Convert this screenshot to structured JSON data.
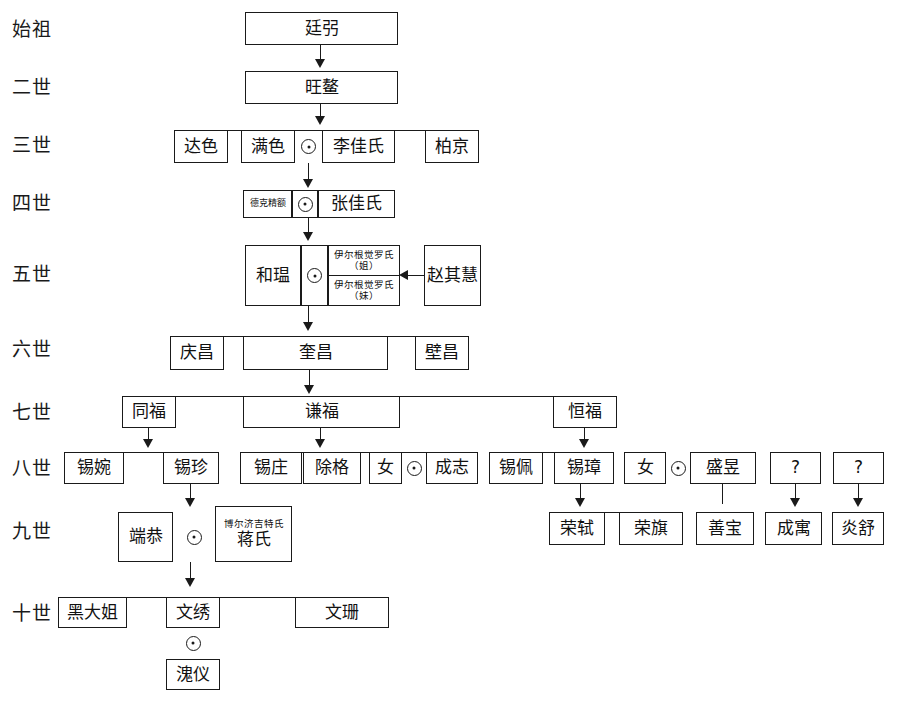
{
  "diagram": {
    "type": "genealogy-tree",
    "ink_color": "#1a1a1a",
    "background": "#ffffff",
    "marriage_symbol": "⊙",
    "unknown_label": "?"
  },
  "generations": [
    {
      "key": "g1",
      "label": "始祖"
    },
    {
      "key": "g2",
      "label": "二世"
    },
    {
      "key": "g3",
      "label": "三世"
    },
    {
      "key": "g4",
      "label": "四世"
    },
    {
      "key": "g5",
      "label": "五世"
    },
    {
      "key": "g6",
      "label": "六世"
    },
    {
      "key": "g7",
      "label": "七世"
    },
    {
      "key": "g8",
      "label": "八世"
    },
    {
      "key": "g9",
      "label": "九世"
    },
    {
      "key": "g10",
      "label": "十世"
    }
  ],
  "people": {
    "g1_1": "廷弜",
    "g2_1": "旺鳌",
    "g3_1": "达色",
    "g3_2": "满色",
    "g3_3": "李佳氏",
    "g3_4": "柏京",
    "g4_1": "德克精额",
    "g4_2": "张佳氏",
    "g5_1": "和瑥",
    "g5_2a": "伊尔根觉罗氏（姐）",
    "g5_2b": "伊尔根觉罗氏（妹）",
    "g5_3": "赵其慧",
    "g6_1": "庆昌",
    "g6_2": "奎昌",
    "g6_3": "壁昌",
    "g7_1": "同福",
    "g7_2": "谦福",
    "g7_3": "恒福",
    "g8_1": "锡婉",
    "g8_2": "锡珍",
    "g8_3": "锡庄",
    "g8_4": "除格",
    "g8_5": "女",
    "g8_6": "成志",
    "g8_7": "锡佩",
    "g8_8": "锡璋",
    "g8_9": "女",
    "g8_10": "盛昱",
    "g8_11": "?",
    "g8_12": "?",
    "g9_1": "端恭",
    "g9_2a": "博尔济吉特氏",
    "g9_2b": "蒋氏",
    "g9_3": "荣轼",
    "g9_4": "荣旗",
    "g9_5": "善宝",
    "g9_6": "成寓",
    "g9_7": "炎舒",
    "g10_1": "黑大姐",
    "g10_2": "文绣",
    "g10_3": "文珊",
    "g10_4": "溾仪"
  }
}
